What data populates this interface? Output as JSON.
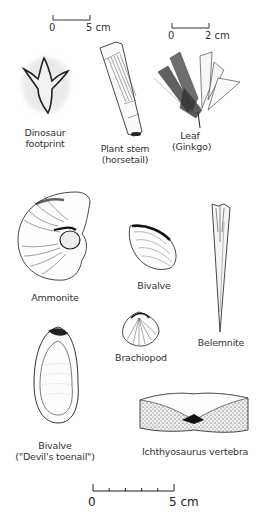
{
  "scales": {
    "top_left": {
      "start": "0",
      "end": "5 cm"
    },
    "top_right": {
      "start": "0",
      "end": "2 cm"
    },
    "bottom": {
      "start": "0",
      "end": "5 cm"
    }
  },
  "fossils": {
    "dinosaur_footprint": {
      "line1": "Dinosaur",
      "line2": "footprint"
    },
    "plant_stem": {
      "line1": "Plant stem",
      "line2": "(horsetail)"
    },
    "leaf": {
      "line1": "Leaf",
      "line2": "(Ginkgo)"
    },
    "ammonite": {
      "line1": "Ammonite"
    },
    "bivalve": {
      "line1": "Bivalve"
    },
    "belemnite": {
      "line1": "Belemnite"
    },
    "brachiopod": {
      "line1": "Brachiopod"
    },
    "devils_toenail": {
      "line1": "Bivalve",
      "line2": "(\"Devil's toenail\")"
    },
    "ichthyosaurus": {
      "line1": "Ichthyosaurus vertebra"
    }
  }
}
